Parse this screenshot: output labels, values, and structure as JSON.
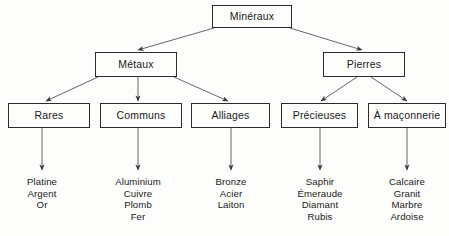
{
  "diagram": {
    "title": "Minéraux",
    "type": "hierarchy-tree",
    "colors": {
      "background": "#fdfdfc",
      "border": "#2b2b2b",
      "text": "#1a1a1a",
      "connector": "#4a4a4a"
    },
    "nodes": {
      "root": {
        "label": "Minéraux",
        "x": 212,
        "y": 5,
        "w": 80,
        "h": 23
      },
      "level2": [
        {
          "key": "metaux",
          "label": "Métaux",
          "x": 95,
          "y": 52,
          "w": 82,
          "h": 25
        },
        {
          "key": "pierres",
          "label": "Pierres",
          "x": 323,
          "y": 52,
          "w": 82,
          "h": 25
        }
      ],
      "level3": [
        {
          "key": "rares",
          "label": "Rares",
          "x": 8,
          "y": 103,
          "w": 82,
          "h": 25
        },
        {
          "key": "communs",
          "label": "Communs",
          "x": 100,
          "y": 103,
          "w": 82,
          "h": 25
        },
        {
          "key": "alliages",
          "label": "Alliages",
          "x": 191,
          "y": 103,
          "w": 79,
          "h": 25
        },
        {
          "key": "precieuses",
          "label": "Précieuses",
          "x": 281,
          "y": 103,
          "w": 77,
          "h": 25
        },
        {
          "key": "maconnerie",
          "label": "À maçonnerie",
          "x": 368,
          "y": 103,
          "w": 78,
          "h": 25
        }
      ]
    },
    "leaf_lists": [
      {
        "key": "rares-items",
        "parent": "rares",
        "cx": 42,
        "y": 176,
        "items": [
          "Platine",
          "Argent",
          "Or"
        ]
      },
      {
        "key": "communs-items",
        "parent": "communs",
        "cx": 138,
        "y": 176,
        "items": [
          "Aluminium",
          "Cuivre",
          "Plomb",
          "Fer"
        ]
      },
      {
        "key": "alliages-items",
        "parent": "alliages",
        "cx": 231,
        "y": 176,
        "items": [
          "Bronze",
          "Acier",
          "Laiton"
        ]
      },
      {
        "key": "precieuses-items",
        "parent": "precieuses",
        "cx": 320,
        "y": 176,
        "items": [
          "Saphir",
          "Émeraude",
          "Diamant",
          "Rubis"
        ]
      },
      {
        "key": "maconnerie-items",
        "parent": "maconnerie",
        "cx": 407,
        "y": 176,
        "items": [
          "Calcaire",
          "Granit",
          "Marbre",
          "Ardoise"
        ]
      }
    ],
    "edges": [
      {
        "from": "root",
        "to": "metaux",
        "x1": 214,
        "y1": 28,
        "x2": 138,
        "y2": 50
      },
      {
        "from": "root",
        "to": "pierres",
        "x1": 290,
        "y1": 28,
        "x2": 362,
        "y2": 50
      },
      {
        "from": "metaux",
        "to": "rares",
        "x1": 98,
        "y1": 77,
        "x2": 46,
        "y2": 101
      },
      {
        "from": "metaux",
        "to": "communs",
        "x1": 138,
        "y1": 77,
        "x2": 138,
        "y2": 101
      },
      {
        "from": "metaux",
        "to": "alliages",
        "x1": 174,
        "y1": 77,
        "x2": 228,
        "y2": 101
      },
      {
        "from": "pierres",
        "to": "precieuses",
        "x1": 357,
        "y1": 77,
        "x2": 321,
        "y2": 101
      },
      {
        "from": "pierres",
        "to": "maconnerie",
        "x1": 371,
        "y1": 77,
        "x2": 407,
        "y2": 101
      },
      {
        "from": "rares",
        "to": "rares-items",
        "x1": 42,
        "y1": 128,
        "x2": 42,
        "y2": 170
      },
      {
        "from": "communs",
        "to": "communs-items",
        "x1": 138,
        "y1": 128,
        "x2": 138,
        "y2": 170
      },
      {
        "from": "alliages",
        "to": "alliages-items",
        "x1": 231,
        "y1": 128,
        "x2": 231,
        "y2": 170
      },
      {
        "from": "precieuses",
        "to": "precieuses-items",
        "x1": 320,
        "y1": 128,
        "x2": 320,
        "y2": 170
      },
      {
        "from": "maconnerie",
        "to": "maconnerie-items",
        "x1": 407,
        "y1": 128,
        "x2": 407,
        "y2": 170
      }
    ]
  }
}
